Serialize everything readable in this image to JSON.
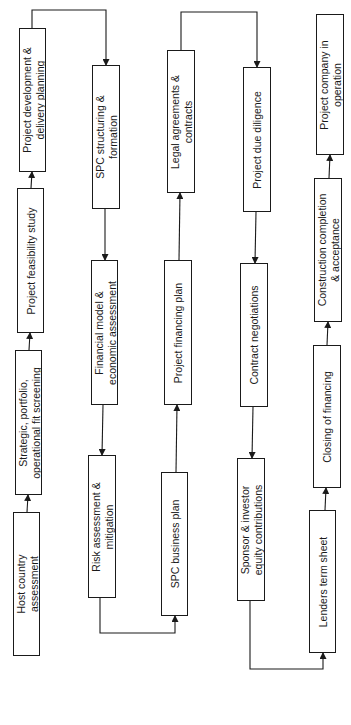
{
  "diagram": {
    "orientation": "rotated-90-ccw",
    "colors": {
      "line": "#1a1a1a",
      "box_fill": "#ffffff",
      "background": "#ffffff"
    },
    "nodes": [
      {
        "id": "host",
        "lines": [
          "Host country",
          "assessment"
        ],
        "x": 13,
        "y": 512,
        "w": 27,
        "h": 144
      },
      {
        "id": "strategic",
        "lines": [
          "Strategic, portfolio,",
          "operational fit screening"
        ],
        "x": 15,
        "y": 350,
        "w": 27,
        "h": 145
      },
      {
        "id": "feasibility",
        "lines": [
          "Project feasibility study"
        ],
        "x": 17,
        "y": 188,
        "w": 27,
        "h": 145
      },
      {
        "id": "projdev",
        "lines": [
          "Project development &",
          "delivery planning"
        ],
        "x": 19,
        "y": 28,
        "w": 27,
        "h": 144
      },
      {
        "id": "spcstruct",
        "lines": [
          "SPC structuring &",
          "formation"
        ],
        "x": 92,
        "y": 65,
        "w": 28,
        "h": 144
      },
      {
        "id": "financial",
        "lines": [
          "Financial model &",
          "economic assessment"
        ],
        "x": 91,
        "y": 260,
        "w": 27,
        "h": 145
      },
      {
        "id": "risk",
        "lines": [
          "Risk assessment &",
          "mitigation"
        ],
        "x": 88,
        "y": 455,
        "w": 28,
        "h": 143
      },
      {
        "id": "spcbiz",
        "lines": [
          "SPC business plan"
        ],
        "x": 161,
        "y": 472,
        "w": 27,
        "h": 144
      },
      {
        "id": "finplan",
        "lines": [
          "Project financing plan"
        ],
        "x": 164,
        "y": 260,
        "w": 28,
        "h": 145
      },
      {
        "id": "legal",
        "lines": [
          "Legal agreements &",
          "contracts"
        ],
        "x": 167,
        "y": 50,
        "w": 28,
        "h": 143
      },
      {
        "id": "duediligence",
        "lines": [
          "Project due diligence"
        ],
        "x": 243,
        "y": 67,
        "w": 28,
        "h": 145
      },
      {
        "id": "contract",
        "lines": [
          "Contract negotiations"
        ],
        "x": 240,
        "y": 263,
        "w": 28,
        "h": 144
      },
      {
        "id": "sponsor",
        "lines": [
          "Sponsor & investor",
          "equity contributions"
        ],
        "x": 237,
        "y": 458,
        "w": 28,
        "h": 143
      },
      {
        "id": "lenders",
        "lines": [
          "Lenders term sheet"
        ],
        "x": 309,
        "y": 510,
        "w": 27,
        "h": 143
      },
      {
        "id": "closing",
        "lines": [
          "Closing of financing"
        ],
        "x": 313,
        "y": 345,
        "w": 28,
        "h": 143
      },
      {
        "id": "construction",
        "lines": [
          "Construction completion",
          "& acceptance"
        ],
        "x": 314,
        "y": 178,
        "w": 28,
        "h": 144
      },
      {
        "id": "projco",
        "lines": [
          "Project company in",
          "operation"
        ],
        "x": 316,
        "y": 14,
        "w": 28,
        "h": 141
      }
    ],
    "edges": [
      {
        "from": "host",
        "to": "strategic",
        "points": [
          [
            27,
            512
          ],
          [
            28,
            495
          ]
        ]
      },
      {
        "from": "strategic",
        "to": "feasibility",
        "points": [
          [
            29,
            350
          ],
          [
            30,
            333
          ]
        ]
      },
      {
        "from": "feasibility",
        "to": "projdev",
        "points": [
          [
            31,
            188
          ],
          [
            32,
            172
          ]
        ]
      },
      {
        "from": "projdev",
        "to": "spcstruct",
        "points": [
          [
            32,
            28
          ],
          [
            32,
            10
          ],
          [
            106,
            10
          ],
          [
            106,
            65
          ]
        ]
      },
      {
        "from": "spcstruct",
        "to": "financial",
        "points": [
          [
            105,
            209
          ],
          [
            105,
            260
          ]
        ]
      },
      {
        "from": "financial",
        "to": "risk",
        "points": [
          [
            103,
            405
          ],
          [
            102,
            455
          ]
        ]
      },
      {
        "from": "risk",
        "to": "spcbiz",
        "points": [
          [
            100,
            598
          ],
          [
            100,
            633
          ],
          [
            175,
            633
          ],
          [
            175,
            616
          ]
        ]
      },
      {
        "from": "spcbiz",
        "to": "finplan",
        "points": [
          [
            176,
            472
          ],
          [
            177,
            405
          ]
        ]
      },
      {
        "from": "finplan",
        "to": "legal",
        "points": [
          [
            179,
            260
          ],
          [
            180,
            193
          ]
        ]
      },
      {
        "from": "legal",
        "to": "duediligence",
        "points": [
          [
            181,
            50
          ],
          [
            181,
            12
          ],
          [
            257,
            12
          ],
          [
            257,
            67
          ]
        ]
      },
      {
        "from": "duediligence",
        "to": "contract",
        "points": [
          [
            256,
            212
          ],
          [
            255,
            263
          ]
        ]
      },
      {
        "from": "contract",
        "to": "sponsor",
        "points": [
          [
            253,
            407
          ],
          [
            252,
            458
          ]
        ]
      },
      {
        "from": "sponsor",
        "to": "lenders",
        "points": [
          [
            250,
            601
          ],
          [
            250,
            669
          ],
          [
            323,
            669
          ],
          [
            323,
            653
          ]
        ]
      },
      {
        "from": "lenders",
        "to": "closing",
        "points": [
          [
            325,
            510
          ],
          [
            326,
            488
          ]
        ]
      },
      {
        "from": "closing",
        "to": "construction",
        "points": [
          [
            327,
            345
          ],
          [
            328,
            322
          ]
        ]
      },
      {
        "from": "construction",
        "to": "projco",
        "points": [
          [
            329,
            178
          ],
          [
            330,
            155
          ]
        ]
      }
    ]
  }
}
